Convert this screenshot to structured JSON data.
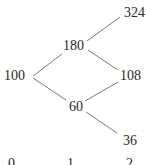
{
  "tree": {
    "type": "binomial-tree",
    "nodes": {
      "root": {
        "label": "100",
        "step": 0
      },
      "up": {
        "label": "180",
        "step": 1
      },
      "down": {
        "label": "60",
        "step": 1
      },
      "up_up": {
        "label": "324",
        "step": 2
      },
      "up_down": {
        "label": "108",
        "step": 2
      },
      "down_down": {
        "label": "36",
        "step": 2
      }
    },
    "edges": [
      {
        "from": "100",
        "to": "180"
      },
      {
        "from": "100",
        "to": "60"
      },
      {
        "from": "180",
        "to": "324"
      },
      {
        "from": "180",
        "to": "108"
      },
      {
        "from": "60",
        "to": "108"
      },
      {
        "from": "60",
        "to": "36"
      }
    ],
    "time_labels": [
      "0",
      "1",
      "2"
    ]
  },
  "colors": {
    "text": "#2a2a2a",
    "line": "#555555",
    "background": "#ffffff"
  }
}
